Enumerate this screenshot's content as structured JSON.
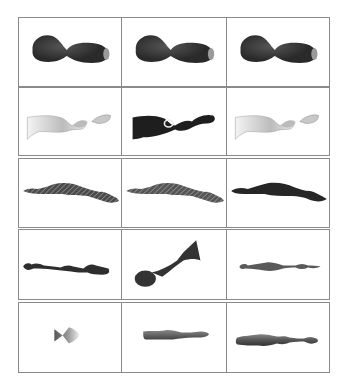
{
  "figure": {
    "layout": {
      "rows": 5,
      "cols": 3,
      "border_color": "#8a8a8a",
      "background": "#ffffff"
    },
    "rows": [
      {
        "cells": [
          {
            "shape": "dark-bowtie",
            "fill": "#2a2a2a",
            "tip": "#9a9a9a"
          },
          {
            "shape": "dark-bowtie",
            "fill": "#2a2a2a",
            "tip": "#9a9a9a"
          },
          {
            "shape": "dark-bowtie",
            "fill": "#2a2a2a",
            "tip": "#9a9a9a"
          }
        ]
      },
      {
        "cells": [
          {
            "shape": "light-bell-segments",
            "fill": "#d8d8d8"
          },
          {
            "shape": "dark-bell-segments",
            "fill": "#1e1e1e"
          },
          {
            "shape": "light-bell-segments",
            "fill": "#d8d8d8"
          }
        ]
      },
      {
        "cells": [
          {
            "shape": "textured-long-body",
            "fill": "#4a4a4a"
          },
          {
            "shape": "textured-long-body",
            "fill": "#555555"
          },
          {
            "shape": "dark-long-body",
            "fill": "#262626"
          }
        ]
      },
      {
        "cells": [
          {
            "shape": "segmented-rod",
            "fill": "#2e2e2e"
          },
          {
            "shape": "club-cone",
            "fill": "#333333"
          },
          {
            "shape": "thin-beaded-rod",
            "fill": "#5a5a5a"
          }
        ]
      },
      {
        "cells": [
          {
            "shape": "small-spool",
            "fill": "#777777"
          },
          {
            "shape": "gray-cylinder-rod",
            "fill": "#666666"
          },
          {
            "shape": "gray-beaded-cylinder",
            "fill": "#555555"
          }
        ]
      }
    ]
  }
}
